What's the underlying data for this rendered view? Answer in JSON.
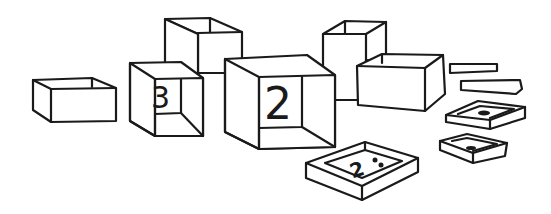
{
  "scene": {
    "description": "Line drawing of open boxes and trays of different sizes",
    "background": "#ffffff",
    "stroke_color": "#1a1a1a",
    "labels": {
      "box_left_center": "3",
      "box_front_center": "2",
      "tray_front": "2",
      "tray_front_dots": "⁚"
    }
  }
}
